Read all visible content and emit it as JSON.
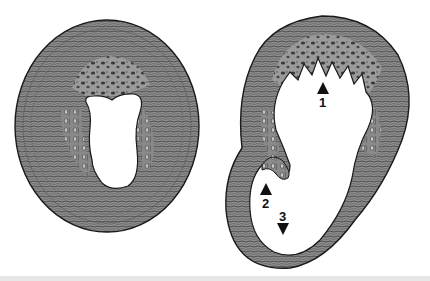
{
  "figure": {
    "panels": [
      {
        "id": "left",
        "description": "Transverse cross-section of thick-walled ring with central lumen"
      },
      {
        "id": "right",
        "description": "Transverse cross-section with trabeculated wall, infolded wall and thin outpouching"
      }
    ],
    "labels": [
      {
        "number": "1",
        "arrow": "up"
      },
      {
        "number": "2",
        "arrow": "up"
      },
      {
        "number": "3",
        "arrow": "down"
      }
    ]
  },
  "colors": {
    "tissue": "#8a8a8a",
    "tissue_dark": "#4a4a4a",
    "outline": "#1a1a1a",
    "lumen": "#ffffff",
    "background": "#ffffff"
  }
}
